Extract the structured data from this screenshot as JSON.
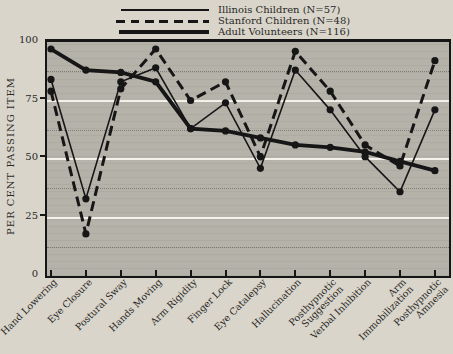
{
  "page": {
    "background": "#d9d5cb"
  },
  "legend": {
    "entries": [
      {
        "label": "Illinois Children (N=57)",
        "series": "illinois"
      },
      {
        "label": "Stanford Children (N=48)",
        "series": "stanford"
      },
      {
        "label": "Adult Volunteers (N=116)",
        "series": "adult"
      }
    ]
  },
  "chart_data": {
    "type": "line",
    "title": "",
    "xlabel": "",
    "ylabel": "PER CENT PASSING ITEM",
    "ylim": [
      0,
      100
    ],
    "yticks": [
      0,
      25,
      50,
      75,
      100
    ],
    "grid": "solid white horizontal lines at 25/50/75; faint dotted lines at 12.5/37.5/62.5/87.5",
    "legend_position": "top-center",
    "categories": [
      "Hand Lowering",
      "Eye Closure",
      "Postural Sway",
      "Hands Moving",
      "Arm Rigidity",
      "Finger Lock",
      "Eye Catalepsy",
      "Hallucination",
      "Posthypnotic\nSuggestion",
      "Verbal Inhibition",
      "Arm Immobilization",
      "Posthypnotic\nAmnesia"
    ],
    "series": [
      {
        "name": "Illinois Children (N=57)",
        "key": "illinois",
        "style": "thin-solid",
        "values": [
          84,
          33,
          83,
          89,
          63,
          74,
          46,
          88,
          71,
          51,
          36,
          71
        ]
      },
      {
        "name": "Stanford Children (N=48)",
        "key": "stanford",
        "style": "dashed",
        "values": [
          79,
          18,
          80,
          97,
          75,
          83,
          51,
          96,
          79,
          56,
          47,
          92
        ]
      },
      {
        "name": "Adult Volunteers (N=116)",
        "key": "adult",
        "style": "thick-solid",
        "values": [
          97,
          88,
          87,
          83,
          63,
          62,
          59,
          56,
          55,
          53,
          49,
          45
        ]
      }
    ],
    "colors": {
      "line": "#161616",
      "plot_bg": "#b5b2aa",
      "paper_bg": "#d9d5cb",
      "gridline": "#f3f1ea"
    }
  }
}
